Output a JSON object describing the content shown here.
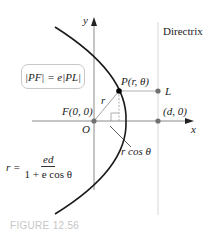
{
  "figure": {
    "caption": "FIGURE 12.56",
    "directrix_label": "Directrix",
    "axis_labels": {
      "x": "x",
      "y": "y"
    },
    "points": {
      "P": "P(r, θ)",
      "L": "L",
      "F": "F(0, 0)",
      "O": "O",
      "d": "(d, 0)"
    },
    "segment_labels": {
      "r": "r",
      "r_cos": "r cos θ"
    },
    "boxed_equation": "|PF| = e|PL|",
    "polar_equation": {
      "lhs": "r =",
      "numerator": "ed",
      "denominator": "1 + e cos θ"
    },
    "colors": {
      "curve": "#1a1a1a",
      "axes": "#808080",
      "directrix": "#d0d0d0",
      "point_gray": "#707070",
      "point_black": "#000000",
      "caption": "#c6c6c6"
    }
  }
}
